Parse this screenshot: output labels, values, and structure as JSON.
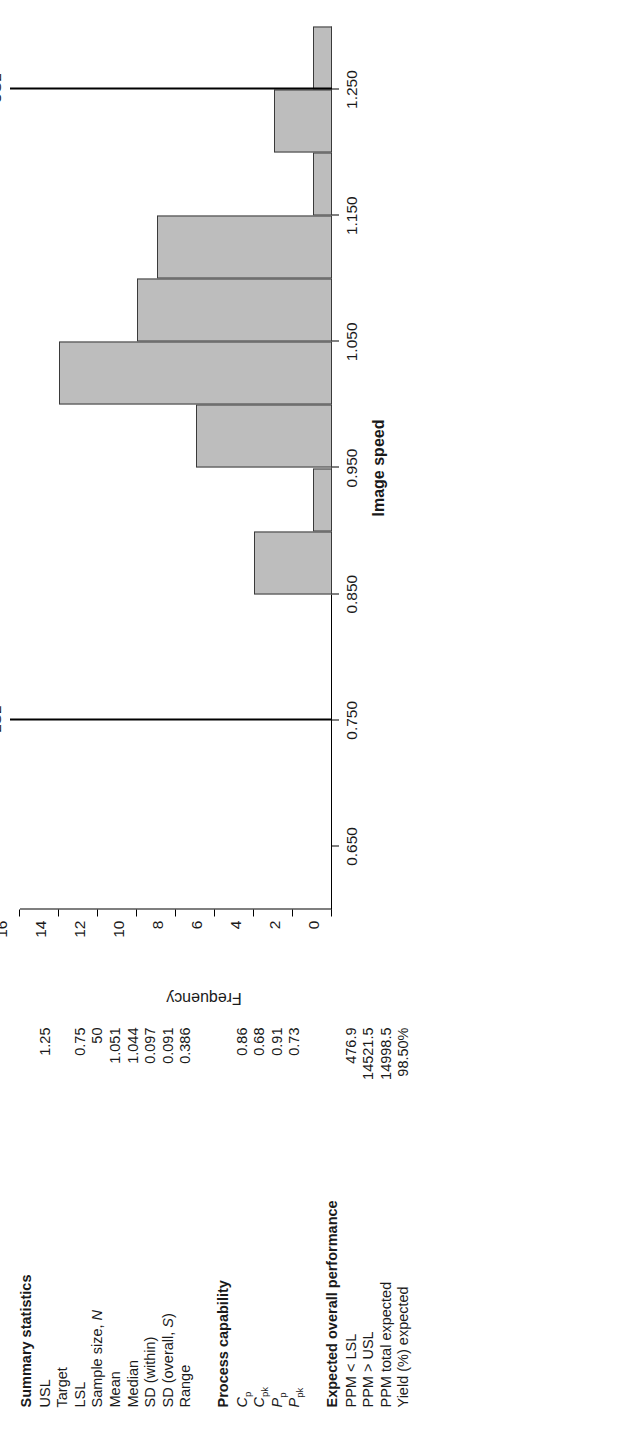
{
  "chart_data": {
    "type": "bar",
    "title": "",
    "xlabel": "Image speed",
    "ylabel": "Frequency",
    "xlim": [
      0.6,
      1.3
    ],
    "ylim": [
      0,
      16
    ],
    "grid": false,
    "legend": "none",
    "xticks": [
      "0.650",
      "0.750",
      "0.850",
      "0.950",
      "1.050",
      "1.150",
      "1.250"
    ],
    "xtick_values": [
      0.65,
      0.75,
      0.85,
      0.95,
      1.05,
      1.15,
      1.25
    ],
    "yticks": [
      "0",
      "2",
      "4",
      "6",
      "8",
      "10",
      "12",
      "14",
      "16"
    ],
    "ytick_values": [
      0,
      2,
      4,
      6,
      8,
      10,
      12,
      14,
      16
    ],
    "bin_edges": [
      0.85,
      0.9,
      0.95,
      1.0,
      1.05,
      1.1,
      1.15,
      1.2,
      1.25,
      1.3
    ],
    "categories": [
      "0.850-0.900",
      "0.900-0.950",
      "0.950-1.000",
      "1.000-1.050",
      "1.050-1.100",
      "1.100-1.150",
      "1.150-1.200",
      "1.200-1.250",
      "1.250-1.300"
    ],
    "values": [
      4,
      1,
      7,
      14,
      10,
      9,
      1,
      3,
      1
    ],
    "bar_color": "#bdbdbd",
    "bar_edge_color": "#3a3a3a",
    "annotations": [
      {
        "label": "LSL",
        "value": 0.75
      },
      {
        "label": "USL",
        "value": 1.25
      }
    ]
  },
  "summary": {
    "heading": "Summary statistics",
    "rows": [
      {
        "label": "USL",
        "value": "1.25"
      },
      {
        "label": "Target",
        "value": ""
      },
      {
        "label": "LSL",
        "value": "0.75"
      },
      {
        "label": "Sample size, N",
        "value": "50"
      },
      {
        "label": "Mean",
        "value": "1.051"
      },
      {
        "label": "Median",
        "value": "1.044"
      },
      {
        "label": "SD (within)",
        "value": "0.097"
      },
      {
        "label": "SD (overall, S)",
        "value": "0.091"
      },
      {
        "label": "Range",
        "value": "0.386"
      }
    ]
  },
  "capability": {
    "heading": "Process capability",
    "rows": [
      {
        "label": "Cp",
        "value": "0.86"
      },
      {
        "label": "Cpk",
        "value": "0.68"
      },
      {
        "label": "Pp",
        "value": "0.91"
      },
      {
        "label": "Ppk",
        "value": "0.73"
      }
    ]
  },
  "performance": {
    "heading": "Expected overall performance",
    "rows": [
      {
        "label": "PPM < LSL",
        "value": "476.9"
      },
      {
        "label": "PPM > USL",
        "value": "14521.5"
      },
      {
        "label": "PPM total expected",
        "value": "14998.5"
      },
      {
        "label": "Yield (%) expected",
        "value": "98.50%"
      }
    ]
  }
}
